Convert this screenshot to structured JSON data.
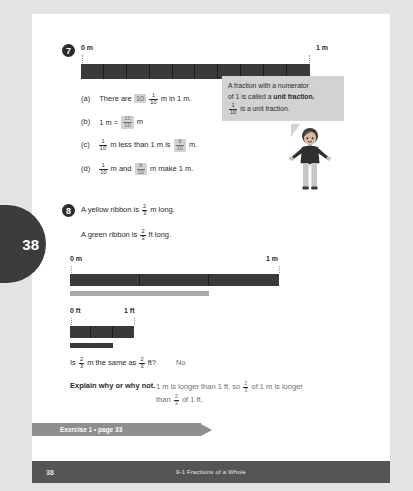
{
  "page": {
    "number": "38",
    "tab_number": "38",
    "chapter_footer": "9-1  Fractions of a Whole",
    "exercise_banner": "Exercise 1 • page 33"
  },
  "q7": {
    "number": "7",
    "left_label": "0 m",
    "right_label": "1 m",
    "parts": 10,
    "items": [
      {
        "letter": "(a)",
        "pre": "There are",
        "answer": "10",
        "frac_num": "1",
        "frac_den": "10",
        "post": "m in 1 m."
      },
      {
        "letter": "(b)",
        "pre": "1 m =",
        "answer_num": "10",
        "answer_den": "10",
        "post": "m"
      },
      {
        "letter": "(c)",
        "frac_num": "1",
        "frac_den": "10",
        "mid": "m less than 1 m is",
        "answer_num": "9",
        "answer_den": "10",
        "post": "m."
      },
      {
        "letter": "(d)",
        "frac_num": "1",
        "frac_den": "10",
        "mid": "m and",
        "answer_num": "9",
        "answer_den": "10",
        "post": "m make 1 m."
      }
    ]
  },
  "bubble": {
    "line1": "A fraction with a numerator",
    "line2_a": "of 1 is called a ",
    "line2_b": "unit fraction.",
    "line3_num": "1",
    "line3_den": "10",
    "line3_text": "is a unit fraction."
  },
  "q8": {
    "number": "8",
    "stmt1_pre": "A yellow ribbon is",
    "stmt1_num": "2",
    "stmt1_den": "3",
    "stmt1_post": "m long.",
    "stmt2_pre": "A green ribbon is",
    "stmt2_num": "2",
    "stmt2_den": "3",
    "stmt2_post": "ft long.",
    "m_left_label": "0 m",
    "m_right_label": "1 m",
    "ft_left_label": "0 ft",
    "ft_right_label": "1 ft",
    "question_pre": "Is",
    "question_num1": "2",
    "question_den1": "3",
    "question_mid": "m the same as",
    "question_num2": "2",
    "question_den2": "3",
    "question_post": "ft?",
    "question_answer": "No",
    "explain_label": "Explain why or why not.",
    "explain_l1_a": "1 m is longer than 1 ft, so",
    "explain_l1_num": "2",
    "explain_l1_den": "3",
    "explain_l1_b": "of 1 m is longer",
    "explain_l2_a": "than",
    "explain_l2_num": "2",
    "explain_l2_den": "3",
    "explain_l2_b": "of 1 ft."
  },
  "colors": {
    "bar_dark": "#3a3a3a",
    "yellow_ribbon": "#a8a8a8",
    "green_ribbon": "#3a3a3a",
    "answer_highlight": "#d2d2d2",
    "tab_dark": "#3c3c3c",
    "footer_bar": "#555555",
    "banner": "#8e8e8e"
  }
}
